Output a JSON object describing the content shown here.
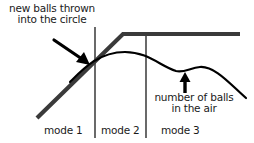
{
  "diagram": {
    "annotations": {
      "new_balls": {
        "line1": "new balls thrown",
        "line2": "into the circle"
      },
      "balls_in_air": {
        "line1": "number of balls",
        "line2": "in the air"
      }
    },
    "modes": [
      {
        "label": "mode 1"
      },
      {
        "label": "mode 2"
      },
      {
        "label": "mode 3"
      }
    ],
    "colors": {
      "thick_line": "#3a3a3a",
      "curve": "#000000",
      "dividers": "#1a1a1a",
      "text": "#1a1a1a"
    }
  }
}
